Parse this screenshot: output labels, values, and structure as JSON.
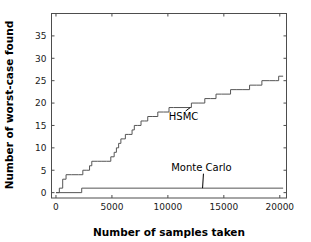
{
  "chart_data": {
    "type": "line",
    "title": "",
    "xlabel": "Number of samples taken",
    "ylabel": "Number of worst-case found",
    "xlim": [
      -400,
      20600
    ],
    "ylim": [
      -1.2,
      40
    ],
    "xticks": [
      0,
      5000,
      10000,
      15000,
      20000
    ],
    "xticklabels": [
      "0",
      "5000",
      "10000",
      "15000",
      "20000"
    ],
    "yticks": [
      0,
      5,
      10,
      15,
      20,
      25,
      30,
      35
    ],
    "yticklabels": [
      "0",
      "5",
      "10",
      "15",
      "20",
      "25",
      "30",
      "35"
    ],
    "grid": false,
    "legend": "inline-annotations",
    "line_color": "#555555",
    "series": [
      {
        "name": "HSMC",
        "step": "post",
        "x": [
          0,
          300,
          600,
          900,
          1400,
          2000,
          2400,
          2700,
          3000,
          3200,
          3400,
          3700,
          4100,
          4500,
          4900,
          5200,
          5400,
          5600,
          5800,
          6000,
          6200,
          6500,
          6800,
          7000,
          7300,
          7600,
          7900,
          8200,
          8600,
          9100,
          9600,
          10100,
          10500,
          12100,
          12700,
          13300,
          13800,
          14300,
          14800,
          15600,
          16100,
          16700,
          17300,
          17900,
          18400,
          19100,
          19600,
          19900,
          20300
        ],
        "y": [
          0,
          1,
          3,
          4,
          4,
          4,
          5,
          5,
          6,
          7,
          7,
          7,
          7,
          7,
          8,
          9,
          10,
          11,
          12,
          12,
          13,
          13,
          14,
          15,
          15,
          16,
          16,
          17,
          17,
          18,
          18,
          19,
          19,
          20,
          20,
          21,
          21,
          22,
          22,
          23,
          23,
          23,
          24,
          24,
          25,
          25,
          25,
          26,
          26
        ],
        "final_value": 26
      },
      {
        "name": "Monte Carlo",
        "step": "post",
        "x": [
          0,
          2300,
          20300
        ],
        "y": [
          0,
          1,
          1
        ],
        "final_value": 1
      }
    ],
    "annotations": [
      {
        "label": "HSMC",
        "text_x": 11400,
        "text_y": 16.2,
        "point_x": 12000,
        "point_y": 19.0
      },
      {
        "label": "Monte Carlo",
        "text_x": 13000,
        "text_y": 4.9,
        "point_x": 13100,
        "point_y": 1.0
      }
    ]
  }
}
